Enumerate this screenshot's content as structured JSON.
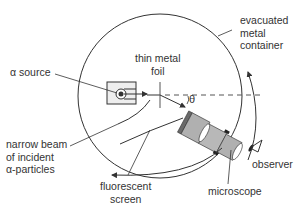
{
  "labels": {
    "alpha_source": "α source",
    "thin_metal_foil": "thin metal\nfoil",
    "evacuated_container": "evacuated\nmetal\ncontainer",
    "narrow_beam": "narrow beam\nof incident\nα-particles",
    "fluorescent_screen": "fluorescent\nscreen",
    "microscope": "microscope",
    "observer": "observer",
    "theta": "θ"
  },
  "colors": {
    "line": "#333333",
    "microscope_body": "#b0b0b0",
    "microscope_dark": "#6a6a6a",
    "source_box": "#eeeeee"
  }
}
